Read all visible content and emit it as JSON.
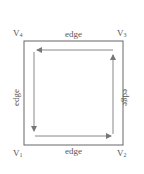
{
  "diagram": {
    "type": "directed-cycle-square",
    "colors": {
      "stroke": "#666666",
      "arrow": "#777777",
      "text": "#555555"
    },
    "vertices": [
      {
        "id": "v1",
        "base": "V",
        "sub": "1",
        "position": "bottom-left"
      },
      {
        "id": "v2",
        "base": "V",
        "sub": "2",
        "position": "bottom-right"
      },
      {
        "id": "v3",
        "base": "V",
        "sub": "3",
        "position": "top-right"
      },
      {
        "id": "v4",
        "base": "V",
        "sub": "4",
        "position": "top-left"
      }
    ],
    "edges": {
      "top": "edge",
      "bottom": "edge",
      "left": "edge",
      "right": "edge"
    },
    "arrows": [
      {
        "side": "bottom",
        "direction": "right",
        "from": "V1",
        "to": "V2"
      },
      {
        "side": "right",
        "direction": "up",
        "from": "V2",
        "to": "V3"
      },
      {
        "side": "top",
        "direction": "left",
        "from": "V3",
        "to": "V4"
      },
      {
        "side": "left",
        "direction": "down",
        "from": "V4",
        "to": "V1"
      }
    ]
  }
}
